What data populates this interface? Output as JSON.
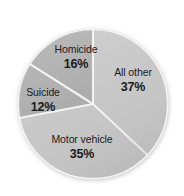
{
  "chart_data": {
    "type": "pie",
    "title": "",
    "subtitle": "",
    "xlabel": "",
    "ylabel": "",
    "legend": "none",
    "grid": false,
    "labels_on_slices": true,
    "start_angle_deg": 0,
    "direction": "clockwise",
    "categories": [
      "All other",
      "Motor vehicle",
      "Suicide",
      "Homicide"
    ],
    "values": [
      37,
      35,
      12,
      16
    ],
    "value_unit": "%",
    "slices": [
      {
        "label": "All other",
        "value": 37,
        "value_text": "37%",
        "color": "#c6c6c6",
        "start_deg": 0,
        "end_deg": 133.2,
        "label_x": 133,
        "label_y": 80
      },
      {
        "label": "Motor vehicle",
        "value": 35,
        "value_text": "35%",
        "color": "#c6c6c6",
        "start_deg": 133.2,
        "end_deg": 259.2,
        "label_x": 82,
        "label_y": 147
      },
      {
        "label": "Suicide",
        "value": 12,
        "value_text": "12%",
        "color": "#a9a9a9",
        "start_deg": 259.2,
        "end_deg": 302.4,
        "label_x": 43,
        "label_y": 100
      },
      {
        "label": "Homicide",
        "value": 16,
        "value_text": "16%",
        "color": "#a9a9a9",
        "start_deg": 302.4,
        "end_deg": 360,
        "label_x": 76,
        "label_y": 57
      }
    ],
    "separator_color": "#f2f2f2",
    "background_color": "#ffffff",
    "label_text_color": "#1b1b1b"
  },
  "geometry": {
    "center_x": 93,
    "center_y": 104,
    "radius": 75
  }
}
